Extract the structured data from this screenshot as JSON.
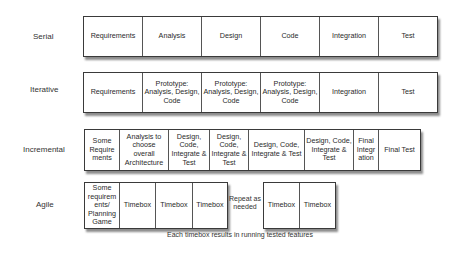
{
  "rows": {
    "serial": {
      "label": "Serial",
      "cells": [
        "Requirements",
        "Analysis",
        "Design",
        "Code",
        "Integration",
        "Test"
      ]
    },
    "iterative": {
      "label": "Iterative",
      "cells": [
        "Requirements",
        "Prototype: Analysis, Design, Code",
        "Prototype: Analysis, Design, Code",
        "Prototype: Analysis, Design, Code",
        "Integration",
        "Test"
      ]
    },
    "incremental": {
      "label": "Incremental",
      "cells": [
        "Some Require ments",
        "Analysis to choose overall Architecture",
        "Design, Code, Integrate & Test",
        "Design, Code, Integrate & Test",
        "Design, Code, Integrate & Test",
        "Design, Code, Integrate & Test",
        "Final Integr ation",
        "Final Test"
      ]
    },
    "agile": {
      "label": "Agile",
      "cells_group1": [
        "Some requirem ents/ Planning Game",
        "Timebox",
        "Timebox",
        "Timebox"
      ],
      "repeat_note": "Repeat as needed",
      "cells_group2": [
        "Timebox",
        "Timebox"
      ],
      "caption": "Each timebox results in running tested features"
    }
  }
}
